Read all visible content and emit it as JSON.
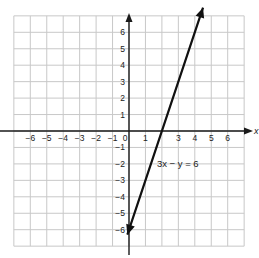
{
  "chart_data": {
    "type": "line",
    "title": "",
    "xlabel": "x",
    "ylabel": "",
    "xlim": [
      -7,
      7
    ],
    "ylim": [
      -7,
      7
    ],
    "grid": true,
    "x_tick_labels": [
      "-6",
      "-5",
      "-4",
      "-3",
      "-2",
      "-1",
      "0",
      "1",
      "3",
      "4",
      "5",
      "6"
    ],
    "y_tick_labels": [
      "6",
      "5",
      "4",
      "3",
      "2",
      "1",
      "-1",
      "-2",
      "-3",
      "-4",
      "-5",
      "-6"
    ],
    "series": [
      {
        "name": "3x − y = 6",
        "equation": "y = 3x - 6",
        "points": [
          [
            -0.1,
            -6.3
          ],
          [
            2,
            0
          ],
          [
            4.5,
            7.5
          ]
        ],
        "arrows": "both"
      }
    ],
    "annotations": [
      {
        "text": "3x − y = 6",
        "x": 2.0,
        "y": -2.2
      }
    ]
  },
  "colors": {
    "grid": "#c8c8c8",
    "axis": "#1a1a1a",
    "line": "#111111",
    "text": "#222222"
  },
  "labels": {
    "x_axis_letter": "x",
    "equation_label": "3x − y = 6"
  }
}
